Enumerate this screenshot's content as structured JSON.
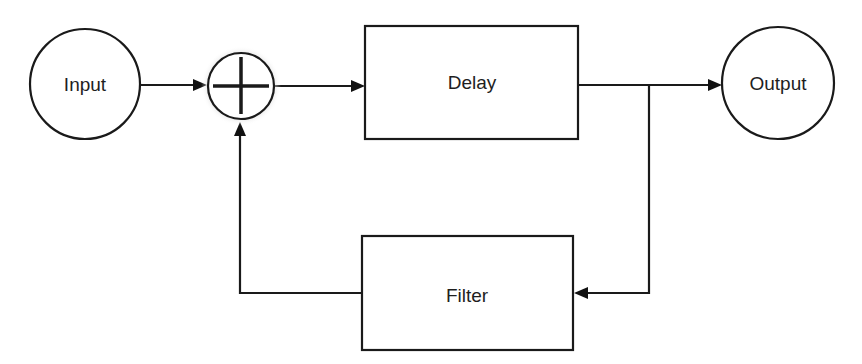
{
  "diagram": {
    "type": "block-diagram",
    "title": "",
    "nodes": [
      {
        "id": "input",
        "shape": "circle",
        "label": "Input"
      },
      {
        "id": "sum",
        "shape": "summing-junction",
        "label": "+"
      },
      {
        "id": "delay",
        "shape": "rect",
        "label": "Delay"
      },
      {
        "id": "output",
        "shape": "circle",
        "label": "Output"
      },
      {
        "id": "filter",
        "shape": "rect",
        "label": "Filter"
      }
    ],
    "edges": [
      {
        "from": "input",
        "to": "sum"
      },
      {
        "from": "sum",
        "to": "delay"
      },
      {
        "from": "delay",
        "to": "output"
      },
      {
        "from": "delay",
        "to": "filter",
        "via": "branch"
      },
      {
        "from": "filter",
        "to": "sum"
      }
    ],
    "colors": {
      "line": "#1a1a1a",
      "background": "#ffffff"
    }
  }
}
